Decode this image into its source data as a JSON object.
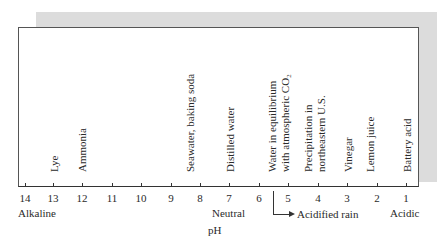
{
  "diagram": {
    "type": "ph-scale",
    "axis": {
      "title": "pH",
      "ticks": [
        "14",
        "13",
        "12",
        "11",
        "10",
        "9",
        "8",
        "7",
        "6",
        "5",
        "4",
        "3",
        "2",
        "1"
      ],
      "left_label": "Alkaline",
      "center_label": "Neutral",
      "right_label": "Acidic",
      "range_annotation": "Acidified rain"
    },
    "substances": [
      {
        "label": "Lye",
        "ph": "13"
      },
      {
        "label": "Ammonia",
        "ph": "12"
      },
      {
        "label": "Seawater, baking soda",
        "ph": "8"
      },
      {
        "label": "Distilled water",
        "ph": "7"
      },
      {
        "label_line1": "Water in equilibrium",
        "label_line2": "with atmospheric CO₂",
        "ph": "5.6"
      },
      {
        "label_line1": "Precipitation in",
        "label_line2": "northeastern U.S.",
        "ph": "4.2"
      },
      {
        "label": "Vinegar",
        "ph": "3"
      },
      {
        "label": "Lemon juice",
        "ph": "2.3"
      },
      {
        "label": "Battery acid",
        "ph": "1"
      }
    ]
  }
}
